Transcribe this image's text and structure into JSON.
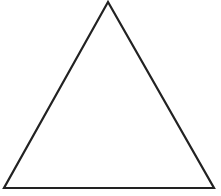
{
  "diagram": {
    "shape": "triangle",
    "kind": "equilateral-outline",
    "stroke_color": "#222222",
    "fill_color": "#ffffff",
    "stroke_width": 2.2,
    "vertices": [
      [
        108,
        2
      ],
      [
        4,
        188
      ],
      [
        214,
        188
      ]
    ]
  }
}
